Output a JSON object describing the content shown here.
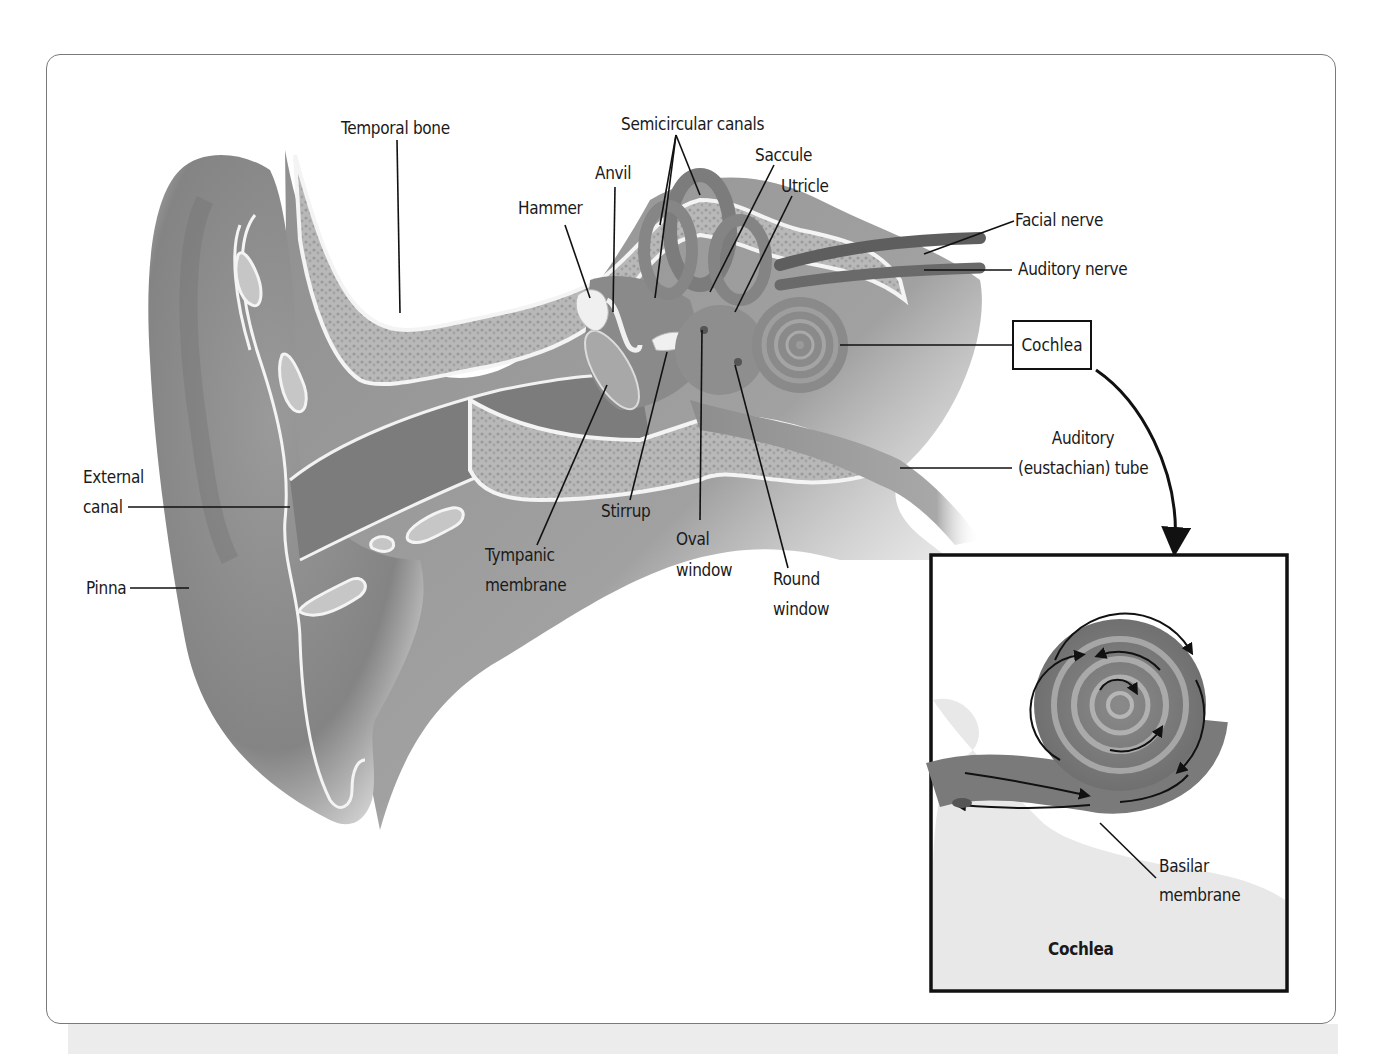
{
  "figure": {
    "labels": {
      "temporal_bone": "Temporal bone",
      "semicircular_canals": "Semicircular canals",
      "saccule": "Saccule",
      "utricle": "Utricle",
      "anvil": "Anvil",
      "hammer": "Hammer",
      "facial_nerve": "Facial nerve",
      "auditory_nerve": "Auditory nerve",
      "cochlea": "Cochlea",
      "auditory_tube_line1": "Auditory",
      "auditory_tube_line2": "(eustachian) tube",
      "external_canal_line1": "External",
      "external_canal_line2": "canal",
      "pinna": "Pinna",
      "stirrup": "Stirrup",
      "tympanic_line1": "Tympanic",
      "tympanic_line2": "membrane",
      "oval_line1": "Oval",
      "oval_line2": "window",
      "round_line1": "Round",
      "round_line2": "window"
    },
    "inset": {
      "title": "Cochlea",
      "basilar_line1": "Basilar",
      "basilar_line2": "membrane"
    },
    "colors": {
      "tissue": "#8c8c8c",
      "tissue_dark": "#6e6e6e",
      "bone": "#b4b4b4",
      "outline": "#ffffff",
      "ink": "#111111",
      "frame": "#7a7a7a"
    }
  }
}
